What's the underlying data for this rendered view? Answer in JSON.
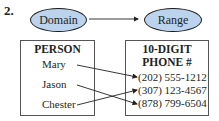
{
  "problem_number": "2.",
  "domain_oval": {
    "label": "Domain"
  },
  "range_oval": {
    "label": "Range"
  },
  "domain_box": {
    "title": "PERSON",
    "items": [
      "Mary",
      "Jason",
      "Chester"
    ]
  },
  "range_box": {
    "title_line1": "10-DIGIT",
    "title_line2": "PHONE #",
    "items": [
      "(202) 555-1212",
      "(307) 123-4567",
      "(878) 799-6504"
    ]
  },
  "mapping": [
    {
      "from": "Mary",
      "to": "(202) 555-1212"
    },
    {
      "from": "Jason",
      "to": "(878) 799-6504"
    },
    {
      "from": "Chester",
      "to": "(307) 123-4567"
    }
  ],
  "colors": {
    "oval_fill": "#bcd3ee",
    "text": "#231f20"
  }
}
